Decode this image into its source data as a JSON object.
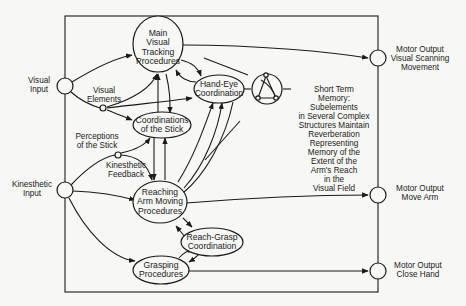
{
  "diagram": {
    "inputs": {
      "visual": "Visual\nInput",
      "kinesthetic": "Kinesthetic\nInput"
    },
    "outputs": {
      "visual_scanning": "Motor Output\nVisual Scanning\nMovement",
      "move_arm": "Motor Output\nMove Arm",
      "close_hand": "Motor Output\nClose Hand"
    },
    "nodes": {
      "main_visual_tracking": "Main\nVisual\nTracking\nProcedures",
      "hand_eye": "Hand-Eye\nCoordination",
      "coordinations_stick": "Coordinations\nof the Stick",
      "reaching_arm": "Reaching\nArm Moving\nProcedures",
      "reach_grasp": "Reach-Grasp\nCoordination",
      "grasping": "Grasping\nProcedures"
    },
    "labels": {
      "visual_elements": "Visual\nElements",
      "perceptions_stick": "Perceptions\nof the Stick",
      "kinesthetic_feedback": "Kinesthetic\nFeedback",
      "short_term_memory": "Short Term\nMemory:\nSubelements\nin Several Complex\nStructures Maintain\nReverberation\nRepresenting\nMemory of the\nExtent of the\nArm's Reach\nin the\nVisual Field"
    },
    "colors": {
      "ink": "#1a1a1a",
      "paper": "#f7f7f5"
    }
  }
}
